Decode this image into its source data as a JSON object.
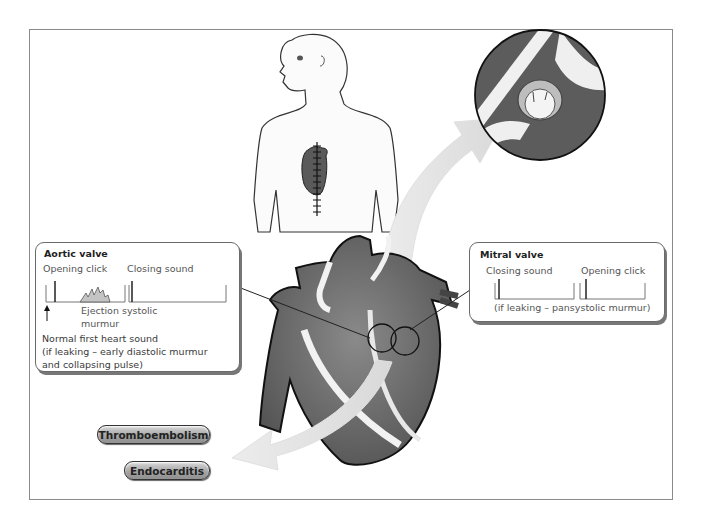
{
  "aortic_box": {
    "title": "Aortic valve",
    "opening_click": "Opening click",
    "closing_sound": "Closing sound",
    "ejection_line1": "Ejection systolic",
    "ejection_line2": "murmur",
    "first_sound_line1": "Normal first heart sound",
    "first_sound_line2": "(if leaking – early diastolic murmur",
    "first_sound_line3": "and collapsing pulse)"
  },
  "mitral_box": {
    "title": "Mitral valve",
    "closing_sound": "Closing sound",
    "opening_click": "Opening click",
    "leak_note": "(if leaking – pansystolic murmur)"
  },
  "complications": {
    "thromboembolism": "Thromboembolism",
    "endocarditis": "Endocarditis"
  },
  "colors": {
    "frame": "#8a8a8a",
    "heart_dark": "#5a5a5a",
    "heart_mid": "#7a7a7a",
    "arrow": "#e4e4e4",
    "pill": "#a6a6a6"
  }
}
